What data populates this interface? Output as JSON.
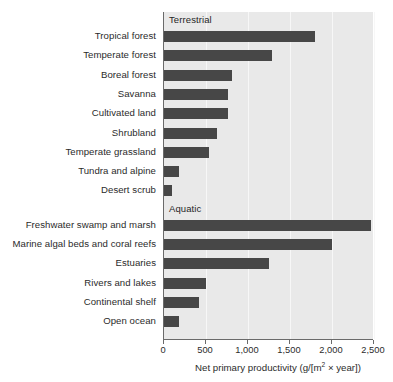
{
  "chart_data": {
    "type": "bar",
    "orientation": "horizontal",
    "title": "",
    "xlabel": "Net primary productivity (g/[m2 × year])",
    "ylabel": "",
    "xlim": [
      0,
      2500
    ],
    "xticks": [
      0,
      500,
      1000,
      1500,
      2000,
      2500
    ],
    "xticklabels": [
      "0",
      "500",
      "1,000",
      "1,500",
      "2,000",
      "2,500"
    ],
    "grid": true,
    "legend": false,
    "bar_color": "#474747",
    "plot_background": "#e9e9e9",
    "groups": [
      {
        "name": "Terrestrial",
        "categories": [
          "Tropical forest",
          "Temperate forest",
          "Boreal forest",
          "Savanna",
          "Cultivated land",
          "Shrubland",
          "Temperate grassland",
          "Tundra and alpine",
          "Desert scrub"
        ],
        "values": [
          1800,
          1290,
          810,
          760,
          760,
          630,
          530,
          180,
          95
        ]
      },
      {
        "name": "Aquatic",
        "categories": [
          "Freshwater swamp and marsh",
          "Marine algal beds and coral reefs",
          "Estuaries",
          "Rivers and lakes",
          "Continental shelf",
          "Open ocean"
        ],
        "values": [
          2470,
          2000,
          1250,
          505,
          415,
          175
        ]
      }
    ],
    "categories": [
      "Tropical forest",
      "Temperate forest",
      "Boreal forest",
      "Savanna",
      "Cultivated land",
      "Shrubland",
      "Temperate grassland",
      "Tundra and alpine",
      "Desert scrub",
      "Freshwater swamp and marsh",
      "Marine algal beds and coral reefs",
      "Estuaries",
      "Rivers and lakes",
      "Continental shelf",
      "Open ocean"
    ],
    "values": [
      1800,
      1290,
      810,
      760,
      760,
      630,
      530,
      180,
      95,
      2470,
      2000,
      1250,
      505,
      415,
      175
    ]
  },
  "axis": {
    "title_prefix": "Net primary productivity (g/[m",
    "title_sup": "2",
    "title_suffix": " × year])"
  }
}
